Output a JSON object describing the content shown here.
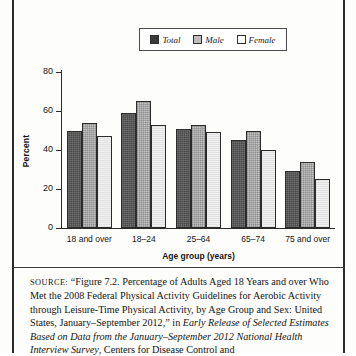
{
  "chart_data": {
    "type": "bar",
    "title": "",
    "xlabel": "Age group (years)",
    "ylabel": "Percent",
    "ylim": [
      0,
      80
    ],
    "yticks": [
      0,
      20,
      40,
      60,
      80
    ],
    "grid": false,
    "legend_position": "top-center",
    "categories": [
      "18 and over",
      "18–24",
      "25–64",
      "65–74",
      "75 and over"
    ],
    "series": [
      {
        "name": "Total",
        "values": [
          50,
          59,
          51,
          45,
          29
        ]
      },
      {
        "name": "Male",
        "values": [
          54,
          65,
          53,
          50,
          34
        ]
      },
      {
        "name": "Female",
        "values": [
          47,
          53,
          49,
          40,
          25
        ]
      }
    ]
  },
  "legend": {
    "items": [
      {
        "label": "Total",
        "swatch": "dark-filled-swatch"
      },
      {
        "label": "Male",
        "swatch": "gray-hatched-swatch"
      },
      {
        "label": "Female",
        "swatch": "white-outline-swatch"
      }
    ]
  },
  "axes": {
    "y_title": "Percent",
    "x_title": "Age group (years)",
    "y_tick_labels": [
      "80",
      "60",
      "40",
      "20",
      "0"
    ],
    "x_tick_labels": [
      "18 and over",
      "18–24",
      "25–64",
      "65–74",
      "75 and over"
    ]
  },
  "source_note": {
    "label": "SOURCE:",
    "line1": " “Figure 7.2. Percentage of Adults Aged 18 Years and over",
    "line2": "Who Met the 2008 Federal Physical Activity Guidelines for Aerobic",
    "line3": "Activity through Leisure-Time Physical Activity, by Age Group and",
    "line4_pre": "Sex: United States, January–September 2012,” in ",
    "line4_italic": "Early Release of",
    "line5_italic": "Selected Estimates Based on Data from the January–September 2012",
    "line6_italic": "National Health Interview Survey",
    "line6_post": ", Centers for Disease Control and"
  }
}
